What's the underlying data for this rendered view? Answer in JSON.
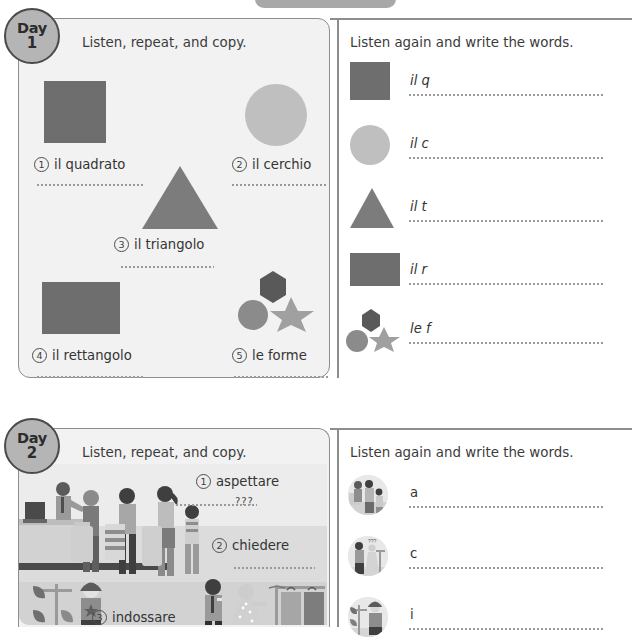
{
  "page": {
    "top_banner": {
      "name": "page-header-banner",
      "color": "#a8a8a8"
    }
  },
  "colors": {
    "panel_bg": "#f2f2f2",
    "panel_border": "#8d8d8d",
    "shape_dark": "#6e6e6e",
    "shape_mid": "#8b8b8b",
    "shape_light": "#bfbfbf",
    "badge_fill": "#b5b5b5",
    "badge_border": "#4a4a4a",
    "text": "#343434",
    "dotted_line": "#9a9a9a"
  },
  "units": [
    {
      "day_word": "Day",
      "day_number": "1",
      "left_instruction": "Listen, repeat, and copy.",
      "right_instruction": "Listen again and write the words.",
      "items": [
        {
          "number": "1",
          "label": "il quadrato",
          "icon": "square-shape",
          "color": "#6e6e6e"
        },
        {
          "number": "2",
          "label": "il cerchio",
          "icon": "circle-shape",
          "color": "#bfbfbf"
        },
        {
          "number": "3",
          "label": "il triangolo",
          "icon": "triangle-shape",
          "color": "#7c7c7c"
        },
        {
          "number": "4",
          "label": "il rettangolo",
          "icon": "rectangle-shape",
          "color": "#6e6e6e"
        },
        {
          "number": "5",
          "label": "le forme",
          "icon": "shapes-group",
          "color": "#8b8b8b"
        }
      ],
      "write_rows": [
        {
          "prompt": "il q",
          "icon": "square-shape",
          "color": "#6e6e6e"
        },
        {
          "prompt": "il c",
          "icon": "circle-shape",
          "color": "#bfbfbf"
        },
        {
          "prompt": "il t",
          "icon": "triangle-shape",
          "color": "#7c7c7c"
        },
        {
          "prompt": "il r",
          "icon": "rectangle-shape",
          "color": "#6e6e6e"
        },
        {
          "prompt": "le f",
          "icon": "shapes-group",
          "color": "#8b8b8b"
        }
      ]
    },
    {
      "day_word": "Day",
      "day_number": "2",
      "left_instruction": "Listen, repeat, and copy.",
      "right_instruction": "Listen again and write the words.",
      "items": [
        {
          "number": "1",
          "label": "aspettare",
          "icon": "queue-scene"
        },
        {
          "number": "2",
          "label": "chiedere",
          "icon": "asking-scene"
        },
        {
          "number": "3",
          "label": "indossare",
          "icon": "wearing-scene"
        }
      ],
      "write_rows": [
        {
          "prompt": "a",
          "icon": "queue-photo-thumbnail"
        },
        {
          "prompt": "c",
          "icon": "asking-photo-thumbnail"
        },
        {
          "prompt": "i",
          "icon": "wearing-photo-thumbnail"
        }
      ],
      "scene_annotation": "???"
    }
  ]
}
